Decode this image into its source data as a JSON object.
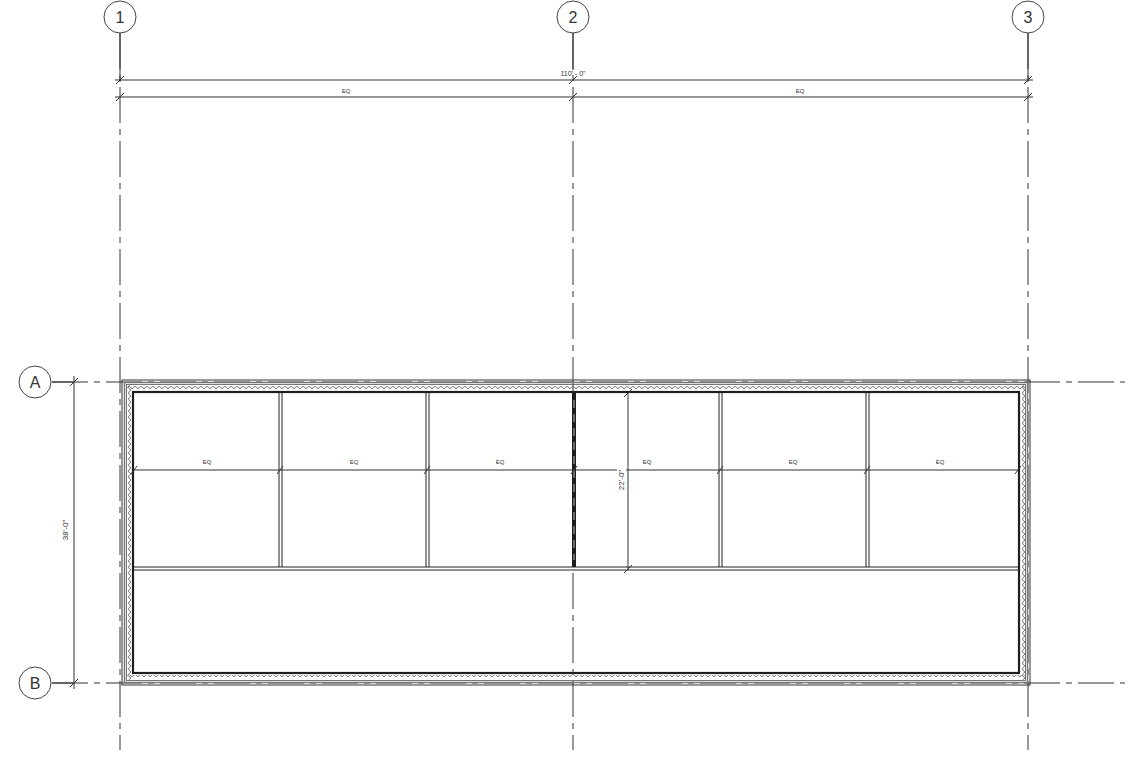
{
  "drawing": {
    "type": "architectural floor plan",
    "grid_columns": [
      {
        "label": "1",
        "x": 120
      },
      {
        "label": "2",
        "x": 573
      },
      {
        "label": "3",
        "x": 1028
      }
    ],
    "grid_rows": [
      {
        "label": "A",
        "y": 382
      },
      {
        "label": "B",
        "y": 683
      }
    ],
    "dimensions": {
      "overall_width": "110' - 0\"",
      "half_bays": [
        "EQ",
        "EQ"
      ],
      "overall_depth": "38'-0\"",
      "room_depth": "22'-0\"",
      "room_widths": [
        "EQ",
        "EQ",
        "EQ",
        "EQ",
        "EQ",
        "EQ"
      ]
    },
    "rooms": {
      "count": 6,
      "partitions_x": [
        280,
        427,
        574,
        720,
        867
      ]
    },
    "colors": {
      "line": "#2a2a2a",
      "wall_fill": "#9a9a9a",
      "background": "#ffffff"
    }
  }
}
